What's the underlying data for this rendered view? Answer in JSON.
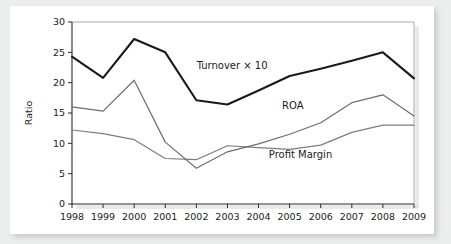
{
  "figure": {
    "card_background": "#ffffff",
    "page_background": "#eceded"
  },
  "chart_data": {
    "type": "line",
    "title": "",
    "xlabel": "",
    "ylabel": "Ratio",
    "x": [
      1998,
      1999,
      2000,
      2001,
      2002,
      2003,
      2004,
      2005,
      2006,
      2007,
      2008,
      2009
    ],
    "categories": [
      "1998",
      "1999",
      "2000",
      "2001",
      "2002",
      "2003",
      "2004",
      "2005",
      "2006",
      "2007",
      "2008",
      "2009"
    ],
    "xlim": [
      1998,
      2009
    ],
    "ylim": [
      0,
      30
    ],
    "yticks": [
      0,
      5,
      10,
      15,
      20,
      25,
      30
    ],
    "ytick_labels": [
      "0",
      "5",
      "10",
      "15",
      "20",
      "25",
      "30"
    ],
    "grid": false,
    "legend_position": "inline-annotations",
    "series": [
      {
        "name": "Turnover × 10",
        "color": "#1a1a1a",
        "width": 2.1,
        "values": [
          24.3,
          20.8,
          27.2,
          25.0,
          17.1,
          16.4,
          18.7,
          21.1,
          22.3,
          23.6,
          25.0,
          20.7
        ],
        "annotation": {
          "label": "Turnover × 10",
          "x": 2003.15,
          "y": 22.2
        }
      },
      {
        "name": "ROA",
        "color": "#6e6e6e",
        "width": 1.2,
        "values": [
          16.0,
          15.3,
          20.4,
          10.2,
          5.9,
          8.6,
          9.9,
          11.5,
          13.4,
          16.7,
          18.0,
          14.5
        ],
        "annotation": {
          "label": "ROA",
          "x": 2005.1,
          "y": 15.6
        }
      },
      {
        "name": "Profit Margin",
        "color": "#7d7d7d",
        "width": 1.2,
        "values": [
          12.2,
          11.6,
          10.6,
          7.5,
          7.3,
          9.6,
          9.3,
          9.0,
          9.7,
          11.8,
          13.0,
          13.0
        ],
        "annotation": {
          "label": "Profit Margin",
          "x": 2005.35,
          "y": 7.6
        }
      }
    ]
  }
}
